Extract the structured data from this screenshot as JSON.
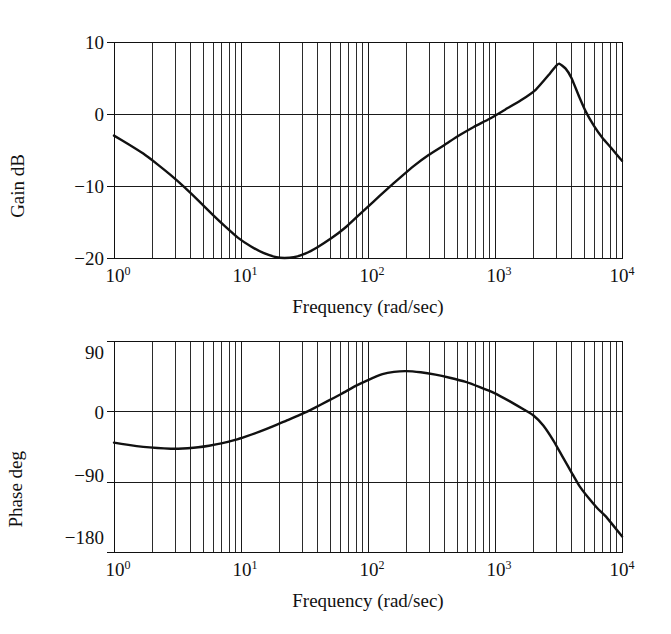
{
  "figure": {
    "kind": "bode-plot",
    "background_color": "#ffffff",
    "ink_color": "#111111"
  },
  "chart_data": [
    {
      "id": "gain",
      "type": "line",
      "title": "",
      "xlabel": "Frequency (rad/sec)",
      "ylabel": "Gain dB",
      "xscale": "log",
      "yscale": "linear",
      "xlim": [
        1,
        10000
      ],
      "ylim": [
        -20,
        10
      ],
      "grid": true,
      "grid_minor": true,
      "legend": "none",
      "xticks": [
        1,
        10,
        100,
        1000,
        10000
      ],
      "xticklabels": [
        "10⁰",
        "10¹",
        "10²",
        "10³",
        "10⁴"
      ],
      "xticklabels_base": [
        "10",
        "10",
        "10",
        "10",
        "10"
      ],
      "xticklabels_exp": [
        "0",
        "1",
        "2",
        "3",
        "4"
      ],
      "yticks": [
        10,
        0,
        -10,
        -20
      ],
      "yticklabels": [
        "10",
        "0",
        "−10",
        "−20"
      ],
      "series": [
        {
          "name": "Gain",
          "x": [
            1,
            1.3,
            1.7,
            2.2,
            2.8,
            3.6,
            4.6,
            6,
            7.5,
            9.5,
            12,
            15,
            19,
            22,
            26,
            32,
            40,
            52,
            66,
            85,
            110,
            140,
            180,
            230,
            300,
            400,
            520,
            680,
            900,
            1200,
            1600,
            2100,
            2700,
            3000,
            3200,
            3600,
            4000,
            4600,
            5200,
            6000,
            7000,
            8200,
            10000
          ],
          "values": [
            -3.0,
            -4.2,
            -5.5,
            -7.0,
            -8.5,
            -10.2,
            -12.0,
            -14.0,
            -15.6,
            -17.2,
            -18.4,
            -19.3,
            -19.9,
            -20.0,
            -19.9,
            -19.4,
            -18.5,
            -17.2,
            -15.8,
            -14.0,
            -12.2,
            -10.5,
            -8.8,
            -7.2,
            -5.7,
            -4.3,
            -3.0,
            -1.8,
            -0.7,
            0.6,
            1.9,
            3.4,
            5.6,
            6.6,
            7.0,
            6.3,
            5.0,
            2.4,
            0.3,
            -1.6,
            -3.3,
            -4.7,
            -6.5
          ]
        }
      ]
    },
    {
      "id": "phase",
      "type": "line",
      "title": "",
      "xlabel": "Frequency (rad/sec)",
      "ylabel": "Phase deg",
      "xscale": "log",
      "yscale": "linear",
      "xlim": [
        1,
        10000
      ],
      "ylim": [
        -180,
        90
      ],
      "grid": true,
      "grid_minor": true,
      "legend": "none",
      "xticks": [
        1,
        10,
        100,
        1000,
        10000
      ],
      "xticklabels": [
        "10⁰",
        "10¹",
        "10²",
        "10³",
        "10⁴"
      ],
      "xticklabels_base": [
        "10",
        "10",
        "10",
        "10",
        "10"
      ],
      "xticklabels_exp": [
        "0",
        "1",
        "2",
        "3",
        "4"
      ],
      "yticks": [
        90,
        0,
        -90,
        -180
      ],
      "yticklabels": [
        "90",
        "0",
        "−90",
        "−180"
      ],
      "series": [
        {
          "name": "Phase",
          "x": [
            1,
            1.3,
            1.7,
            2.2,
            2.8,
            3.2,
            3.8,
            4.6,
            5.6,
            7,
            9,
            11,
            14,
            18,
            23,
            30,
            38,
            48,
            62,
            80,
            100,
            130,
            160,
            200,
            260,
            340,
            440,
            580,
            760,
            1000,
            1300,
            1700,
            2000,
            2400,
            2900,
            3400,
            4000,
            4600,
            5400,
            6400,
            7600,
            10000
          ],
          "values": [
            -40.0,
            -43.0,
            -45.5,
            -47.0,
            -47.8,
            -47.8,
            -47.2,
            -46.0,
            -44.0,
            -41.0,
            -36.5,
            -32.0,
            -26.0,
            -19.0,
            -11.5,
            -3.5,
            4.5,
            13.0,
            22.5,
            32.5,
            40.0,
            47.5,
            50.5,
            51.5,
            50.0,
            47.0,
            43.0,
            38.0,
            31.0,
            23.0,
            13.0,
            2.0,
            -5.0,
            -18.0,
            -38.0,
            -58.0,
            -78.0,
            -95.0,
            -110.0,
            -124.0,
            -136.0,
            -160.0
          ]
        }
      ]
    }
  ],
  "gain_panel": {
    "y_axis_title": "Gain dB",
    "x_axis_title": "Frequency (rad/sec)"
  },
  "phase_panel": {
    "y_axis_title": "Phase deg",
    "x_axis_title": "Frequency (rad/sec)"
  }
}
